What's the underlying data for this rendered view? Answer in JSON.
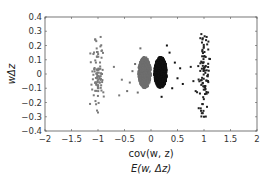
{
  "chart_data": {
    "type": "scatter",
    "title": "",
    "xlabel": "cov(w, z)",
    "xlabel2": "E(w, Δz)",
    "ylabel": "wΔz",
    "xlim": [
      -2,
      2
    ],
    "ylim": [
      -0.4,
      0.4
    ],
    "xticks": [
      -2,
      -1.5,
      -1,
      -0.5,
      0,
      0.5,
      1,
      1.5,
      2
    ],
    "xtick_labels": [
      "-2",
      "-1.5",
      "-1",
      "-0.5",
      "0",
      "0.5",
      "1",
      "1.5",
      "2"
    ],
    "yticks": [
      0.4,
      0.3,
      0.2,
      0.1,
      0,
      -0.1,
      -0.2,
      -0.3,
      -0.4
    ],
    "ytick_labels": [
      "0.4",
      "0.3",
      "0.2",
      "0.1",
      "0",
      "-0.1",
      "-0.2",
      "-0.3",
      "-0.4"
    ],
    "grid": false,
    "legend": null,
    "series": [
      {
        "name": "cluster-left",
        "color": "#7a7a7a",
        "center_x": -1.0,
        "spread_x": 0.12,
        "y_range": [
          -0.27,
          0.26
        ],
        "count": 90,
        "outliers": [
          [
            -1.05,
            0.24
          ],
          [
            -0.95,
            0.26
          ],
          [
            -1.15,
            -0.21
          ],
          [
            -1.0,
            -0.27
          ],
          [
            -0.6,
            -0.15
          ],
          [
            -0.7,
            0.05
          ],
          [
            -0.55,
            -0.04
          ]
        ]
      },
      {
        "name": "cluster-center-gray",
        "color": "#6e6e6e",
        "center_x": -0.12,
        "spread_x": 0.12,
        "y_range": [
          -0.1,
          0.12
        ],
        "count": 900,
        "outliers": [
          [
            -0.35,
            0.02
          ],
          [
            -0.4,
            -0.06
          ],
          [
            -0.3,
            0.07
          ],
          [
            -0.45,
            -0.12
          ],
          [
            -0.2,
            0.18
          ],
          [
            -0.25,
            -0.13
          ]
        ]
      },
      {
        "name": "cluster-center-black",
        "color": "#111111",
        "center_x": 0.18,
        "spread_x": 0.12,
        "y_range": [
          -0.1,
          0.12
        ],
        "count": 900,
        "outliers": [
          [
            0.45,
            0.08
          ],
          [
            0.5,
            -0.03
          ],
          [
            0.55,
            0.04
          ],
          [
            0.6,
            -0.07
          ],
          [
            0.4,
            -0.1
          ],
          [
            0.35,
            0.15
          ],
          [
            0.3,
            0.2
          ],
          [
            0.2,
            -0.16
          ]
        ]
      },
      {
        "name": "cluster-right",
        "color": "#222222",
        "center_x": 1.0,
        "spread_x": 0.1,
        "y_range": [
          -0.3,
          0.28
        ],
        "count": 90,
        "outliers": [
          [
            0.95,
            0.28
          ],
          [
            1.05,
            0.26
          ],
          [
            0.9,
            -0.24
          ],
          [
            1.0,
            -0.3
          ],
          [
            0.75,
            0.05
          ],
          [
            0.8,
            -0.05
          ]
        ]
      }
    ]
  }
}
